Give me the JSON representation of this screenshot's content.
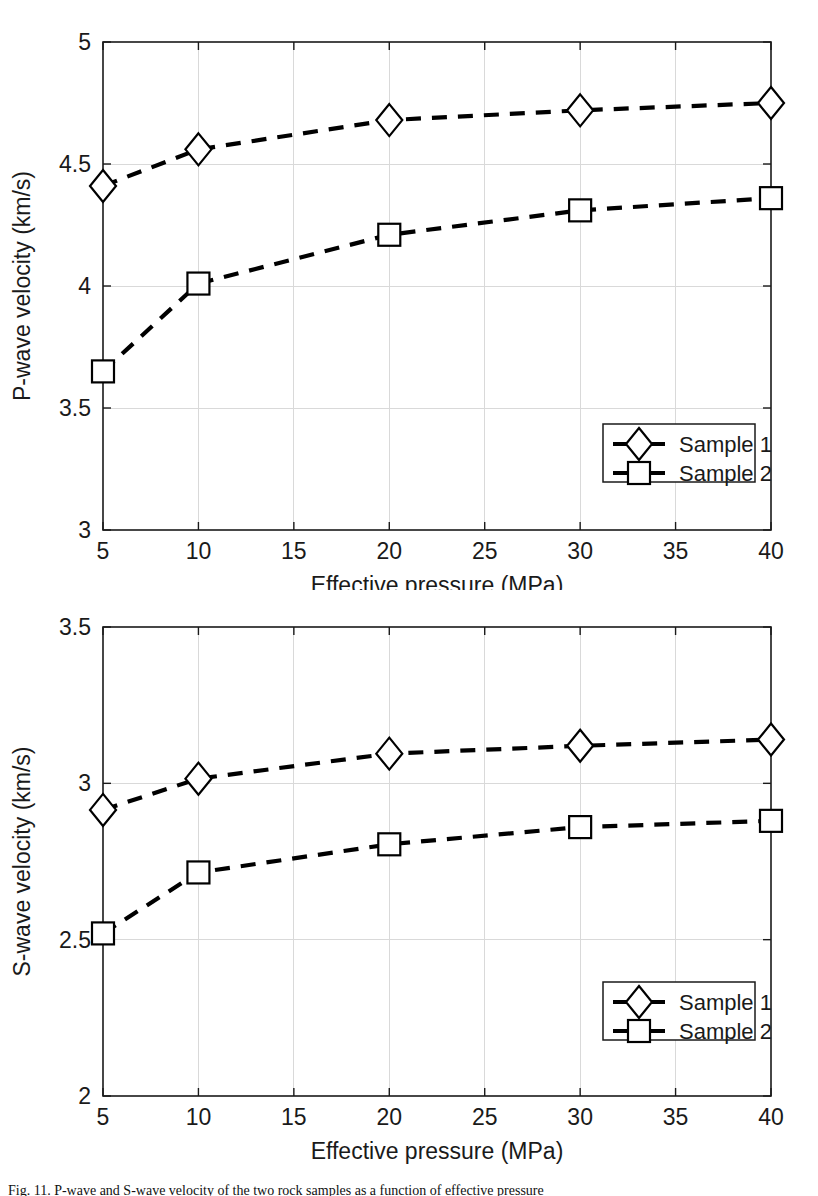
{
  "figure": {
    "caption": "Fig. 11.  P-wave and S-wave velocity of the two rock samples as a function of effective pressure"
  },
  "chart_data": [
    {
      "id": "p-wave",
      "type": "line",
      "title": "",
      "xlabel": "Effective pressure (MPa)",
      "ylabel": "P-wave velocity (km/s)",
      "x": [
        5,
        10,
        20,
        30,
        40
      ],
      "xlim": [
        5,
        40
      ],
      "ylim": [
        3,
        5
      ],
      "xticks": [
        5,
        10,
        15,
        20,
        25,
        30,
        35,
        40
      ],
      "xticklabels": [
        "5",
        "10",
        "15",
        "20",
        "25",
        "30",
        "35",
        "40"
      ],
      "yticks": [
        3,
        3.5,
        4,
        4.5,
        5
      ],
      "yticklabels": [
        "3",
        "3.5",
        "4",
        "4.5",
        "5"
      ],
      "grid": true,
      "legend_position": "lower right",
      "series": [
        {
          "name": "Sample 1",
          "marker": "diamond",
          "linestyle": "dashed",
          "values": [
            4.41,
            4.56,
            4.68,
            4.72,
            4.75
          ]
        },
        {
          "name": "Sample 2",
          "marker": "square",
          "linestyle": "dashed",
          "values": [
            3.65,
            4.01,
            4.21,
            4.31,
            4.36
          ]
        }
      ]
    },
    {
      "id": "s-wave",
      "type": "line",
      "title": "",
      "xlabel": "Effective pressure (MPa)",
      "ylabel": "S-wave velocity (km/s)",
      "x": [
        5,
        10,
        20,
        30,
        40
      ],
      "xlim": [
        5,
        40
      ],
      "ylim": [
        2,
        3.5
      ],
      "xticks": [
        5,
        10,
        15,
        20,
        25,
        30,
        35,
        40
      ],
      "xticklabels": [
        "5",
        "10",
        "15",
        "20",
        "25",
        "30",
        "35",
        "40"
      ],
      "yticks": [
        2,
        2.5,
        3,
        3.5
      ],
      "yticklabels": [
        "2",
        "2.5",
        "3",
        "3.5"
      ],
      "grid": true,
      "legend_position": "lower right",
      "series": [
        {
          "name": "Sample 1",
          "marker": "diamond",
          "linestyle": "dashed",
          "values": [
            2.915,
            3.015,
            3.095,
            3.12,
            3.14
          ]
        },
        {
          "name": "Sample 2",
          "marker": "square",
          "linestyle": "dashed",
          "values": [
            2.52,
            2.715,
            2.805,
            2.86,
            2.88
          ]
        }
      ]
    }
  ],
  "colors": {
    "line": "#000000",
    "marker_fill": "#ffffff",
    "axis": "#1a1a1a",
    "grid": "#d9d9d9",
    "background": "#ffffff"
  }
}
